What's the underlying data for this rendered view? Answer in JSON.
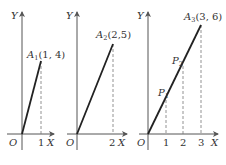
{
  "figure": {
    "panels": [
      {
        "y_axis_label": "Y",
        "x_axis_label": "X",
        "origin_label": "O",
        "x_ticks": [
          "1"
        ],
        "point": {
          "name": "A",
          "sub": "1",
          "coords": "(1, 4)"
        }
      },
      {
        "y_axis_label": "Y",
        "x_axis_label": "X",
        "origin_label": "O",
        "x_ticks": [
          "2"
        ],
        "point": {
          "name": "A",
          "sub": "2",
          "coords": "(2,5)"
        }
      },
      {
        "y_axis_label": "Y",
        "x_axis_label": "X",
        "origin_label": "O",
        "x_ticks": [
          "1",
          "2",
          "3"
        ],
        "point": {
          "name": "A",
          "sub": "3",
          "coords": "(3, 6)"
        },
        "intermediate_points": [
          {
            "name": "P",
            "sub": "1"
          },
          {
            "name": "P",
            "sub": "2"
          }
        ]
      }
    ]
  }
}
